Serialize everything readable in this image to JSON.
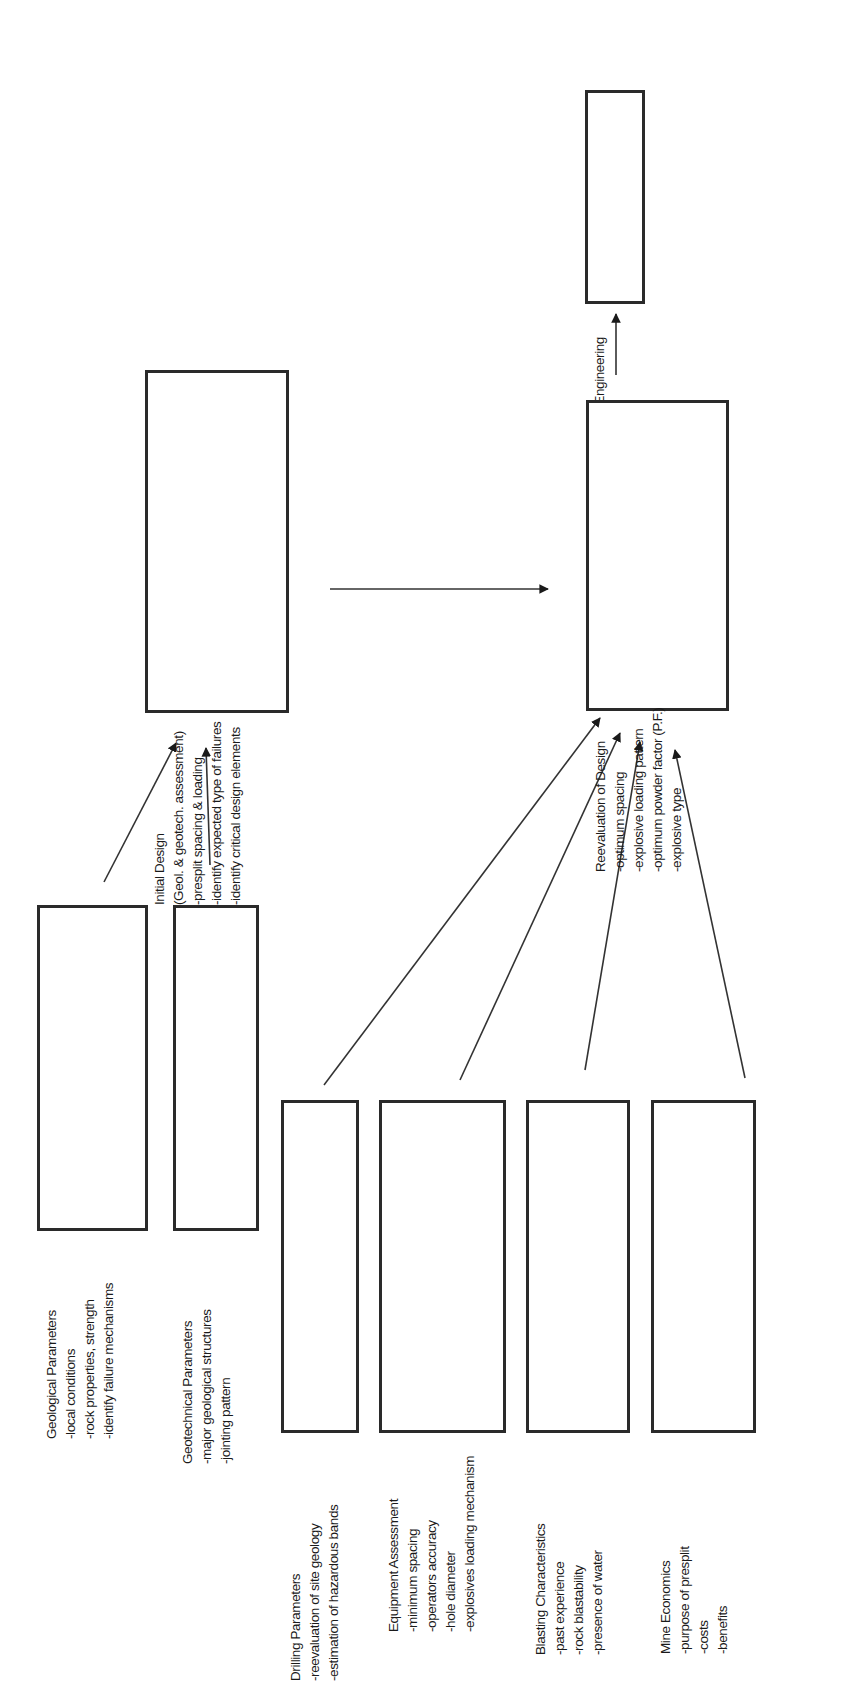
{
  "diagram": {
    "nodes": {
      "provide": {
        "title": "Provide Engineering",
        "items": [
          "Solution"
        ]
      },
      "reevaluation": {
        "title": "Reevaluation of Design",
        "items": [
          "-optimum spacing",
          "-explosive loading pattern",
          "-optimum powder factor (P.F.)",
          "-explosive type"
        ]
      },
      "initial": {
        "title": "Initial Design",
        "items": [
          "(Geol. & geotech. assessment)",
          "-presplit spacing & loading",
          "-identify expected type of failures",
          "-identify critical design elements"
        ]
      },
      "geological": {
        "title": "Geological Parameters",
        "items": [
          "-local conditions",
          "-rock properties, strength",
          "-identify failure mechanisms"
        ]
      },
      "geotechnical": {
        "title": "Geotechnical Parameters",
        "items": [
          "-major geological structures",
          "-jointing pattern"
        ]
      },
      "drilling": {
        "title": "Drilling Parameters",
        "items": [
          "-reevaluation of site geology",
          "-estimation of hazardous bands"
        ]
      },
      "equipment": {
        "title": "Equipment Assessment",
        "items": [
          "-minimum spacing",
          "-operators accuracy",
          "-hole diameter",
          "-explosives loading mechanism"
        ]
      },
      "blasting": {
        "title": "Blasting Characteristics",
        "items": [
          "-past experience",
          "-rock blastability",
          "-presence of water"
        ]
      },
      "economics": {
        "title": "Mine Economics",
        "items": [
          "-purpose of presplit",
          "-costs",
          "-benefits"
        ]
      }
    },
    "edges": [
      {
        "from": "geological",
        "to": "initial"
      },
      {
        "from": "geotechnical",
        "to": "initial"
      },
      {
        "from": "initial",
        "to": "reevaluation"
      },
      {
        "from": "drilling",
        "to": "reevaluation"
      },
      {
        "from": "equipment",
        "to": "reevaluation"
      },
      {
        "from": "blasting",
        "to": "reevaluation"
      },
      {
        "from": "economics",
        "to": "reevaluation"
      },
      {
        "from": "reevaluation",
        "to": "provide"
      }
    ]
  }
}
